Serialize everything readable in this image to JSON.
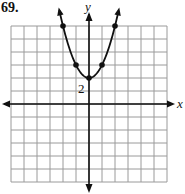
{
  "problem": {
    "number": "69."
  },
  "axes": {
    "x_label": "x",
    "y_label": "y"
  },
  "annotations": {
    "vertex_label": "2"
  },
  "colors": {
    "grid": "#9a9a9a",
    "axis": "#111111",
    "curve": "#111111",
    "background": "#ffffff"
  },
  "chart_data": {
    "type": "line",
    "title": "69.",
    "function": "f(x) = x^2 + 2",
    "xlabel": "x",
    "ylabel": "y",
    "xlim": [
      -6,
      6
    ],
    "ylim": [
      -6,
      6
    ],
    "grid": true,
    "grid_step": 1,
    "legend": "none",
    "series": [
      {
        "name": "parabola",
        "points": [
          {
            "x": -2,
            "y": 6
          },
          {
            "x": -1,
            "y": 3
          },
          {
            "x": 0,
            "y": 2
          },
          {
            "x": 1,
            "y": 3
          },
          {
            "x": 2,
            "y": 6
          }
        ],
        "arrows_at_ends": true
      }
    ],
    "annotations": [
      {
        "text": "2",
        "x": 0,
        "y": 2,
        "position": "below-left"
      }
    ]
  }
}
